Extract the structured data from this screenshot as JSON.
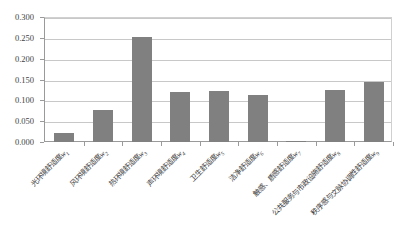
{
  "chart_data": {
    "type": "bar",
    "title": "",
    "subtitle": "",
    "xlabel": "",
    "ylabel": "",
    "ylim": [
      0.0,
      0.3
    ],
    "ytick_labels": [
      "0.300",
      "0.250",
      "0.200",
      "0.150",
      "0.100",
      "0.050",
      "0.000"
    ],
    "ytick_values": [
      0.3,
      0.25,
      0.2,
      0.15,
      0.1,
      0.05,
      0.0
    ],
    "grid": true,
    "legend": false,
    "legend_position": "none",
    "bar_color": "#808080",
    "categories": [
      "光环境舒适度w1",
      "风环境舒适度w2",
      "热环境舒适度w3",
      "声环境舒适度w4",
      "卫生舒适度w5",
      "洁净舒适度w6",
      "触感、质感舒适度w7",
      "公共服务与市政设施舒适度w8",
      "秩序感与文脉协调性舒适度w9"
    ],
    "values": [
      0.022,
      0.077,
      0.252,
      0.12,
      0.122,
      0.113,
      0.002,
      0.125,
      0.144
    ],
    "bars": [
      {
        "base": "光环境舒适度",
        "var": "w",
        "sub": "1",
        "value": 0.022
      },
      {
        "base": "风环境舒适度",
        "var": "w",
        "sub": "2",
        "value": 0.077
      },
      {
        "base": "热环境舒适度",
        "var": "w",
        "sub": "3",
        "value": 0.252
      },
      {
        "base": "声环境舒适度",
        "var": "w",
        "sub": "4",
        "value": 0.12
      },
      {
        "base": "卫生舒适度",
        "var": "w",
        "sub": "5",
        "value": 0.122
      },
      {
        "base": "洁净舒适度",
        "var": "w",
        "sub": "6",
        "value": 0.113
      },
      {
        "base": "触感、质感舒适度",
        "var": "w",
        "sub": "7",
        "value": 0.002
      },
      {
        "base": "公共服务与市政设施舒适度",
        "var": "w",
        "sub": "8",
        "value": 0.125
      },
      {
        "base": "秩序感与文脉协调性舒适度",
        "var": "w",
        "sub": "9",
        "value": 0.144
      }
    ]
  },
  "colors": {
    "bar": "#808080",
    "gridline": "#c8c8c8",
    "axis": "#9a9a9a",
    "text": "#3f3f3f",
    "background": "#ffffff"
  }
}
